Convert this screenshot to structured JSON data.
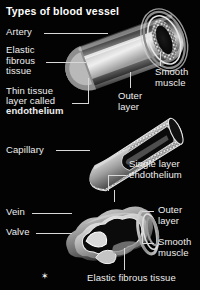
{
  "figure": {
    "title": "Types of blood vessel",
    "background_color": "#030303",
    "text_color": "#eeeeee",
    "style": "grayscale anatomical cutaway illustration"
  },
  "labels": {
    "artery": "Artery",
    "elastic_fibrous_tissue": "Elastic\nfibrous\ntissue",
    "thin_tissue_line1": "Thin tissue",
    "thin_tissue_line2": "layer called",
    "thin_tissue_line3": "endothelium",
    "smooth_muscle_top": "Smooth\nmuscle",
    "outer_layer_top": "Outer\nlayer",
    "capillary": "Capillary",
    "single_layer_endothelium": "Single layer\nendothelium",
    "vein": "Vein",
    "valve": "Valve",
    "outer_layer_bottom": "Outer\nlayer",
    "smooth_muscle_bottom": "Smooth\nmuscle",
    "elastic_fibrous_tissue_bottom": "Elastic fibrous tissue",
    "scale_marker": "✶"
  },
  "vessels": [
    {
      "name": "artery",
      "description": "Thick-walled cutaway cylinder with layered wall and speckled smooth muscle layer"
    },
    {
      "name": "capillary",
      "description": "Narrow tapered tube with single speckled endothelial layer"
    },
    {
      "name": "vein",
      "description": "Wide irregular cutaway tube containing internal valve flaps"
    }
  ]
}
